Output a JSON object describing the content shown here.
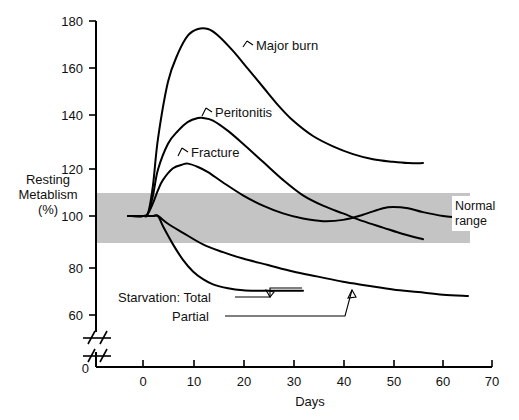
{
  "chart_data": {
    "type": "line",
    "title": "",
    "xlabel": "Days",
    "ylabel": "Resting Metablism (%)",
    "ylabel_lines": [
      "Resting",
      "Metablism",
      "(%)"
    ],
    "xlim": [
      -3,
      70
    ],
    "ylim": [
      50,
      180
    ],
    "y_axis_broken": true,
    "y_break_note": "axis break between 0 and 60",
    "grid": false,
    "legend_position": "inline-annotations",
    "x_ticks": [
      0,
      10,
      20,
      30,
      40,
      50,
      60,
      70
    ],
    "x_tick_labels": [
      "0",
      "10",
      "20",
      "30",
      "40",
      "50",
      "60",
      "70"
    ],
    "y_ticks": [
      60,
      80,
      100,
      120,
      140,
      160,
      180
    ],
    "y_tick_labels": [
      "60",
      "80",
      "100",
      "120",
      "140",
      "160",
      "180"
    ],
    "y_origin_label": "0",
    "bands": [
      {
        "name": "Normal range",
        "label": "Normal range",
        "label_lines": [
          "Normal",
          "range"
        ],
        "y_min": 90,
        "y_max": 110,
        "color": "#c4c4c4"
      }
    ],
    "series": [
      {
        "name": "Major burn",
        "label": "Major burn",
        "x": [
          -3,
          0,
          1,
          2,
          3,
          5,
          7,
          9,
          11,
          13,
          15,
          18,
          21,
          24,
          27,
          30,
          34,
          38,
          42,
          46,
          50,
          53,
          56
        ],
        "values": [
          100,
          100,
          101,
          112,
          130,
          152,
          163,
          170,
          172.5,
          172.5,
          170,
          164,
          157,
          150,
          143,
          137,
          131,
          127,
          124,
          122,
          121,
          120.5,
          120.5
        ]
      },
      {
        "name": "Peritonitis",
        "label": "Peritonitis",
        "x": [
          -3,
          0,
          1,
          2,
          3,
          5,
          7,
          9,
          11,
          12,
          14,
          17,
          20,
          24,
          28,
          32,
          36,
          40,
          44,
          48,
          52,
          56
        ],
        "values": [
          100,
          100,
          101,
          108,
          118,
          128,
          133,
          136.5,
          138,
          138,
          137,
          133,
          128,
          121,
          114,
          108,
          104,
          101,
          98,
          95.5,
          93,
          91
        ]
      },
      {
        "name": "Fracture",
        "label": "Fracture",
        "x": [
          -3,
          0,
          1,
          2,
          3,
          4,
          6,
          8,
          9,
          11,
          13,
          16,
          20,
          24,
          28,
          32,
          36,
          40,
          44,
          48,
          50,
          53,
          56,
          60,
          63,
          65
        ],
        "values": [
          100,
          100,
          101,
          105,
          110,
          114,
          118.5,
          120,
          120.3,
          119,
          117,
          113,
          108,
          104,
          101,
          99,
          98,
          98.5,
          100.5,
          103,
          103.5,
          103,
          101.5,
          100,
          99.5,
          99.5
        ]
      },
      {
        "name": "Starvation: Partial",
        "label": "Partial",
        "legend_prefix": "Starvation:",
        "x": [
          -3,
          0,
          2,
          3,
          5,
          8,
          12,
          16,
          20,
          25,
          30,
          35,
          40,
          45,
          50,
          55,
          60,
          65
        ],
        "values": [
          100,
          100,
          100,
          100,
          97,
          93.5,
          89,
          86,
          83.5,
          81,
          78.5,
          76.5,
          74.5,
          73,
          71.5,
          70.5,
          69.5,
          69
        ]
      },
      {
        "name": "Starvation: Total",
        "label": "Total",
        "legend_prefix": "Starvation:",
        "x": [
          -3,
          0,
          2,
          3,
          4,
          6,
          8,
          10,
          12,
          14,
          17,
          20,
          23,
          26,
          29,
          32
        ],
        "values": [
          100,
          100,
          100,
          100,
          96,
          89,
          83,
          78.5,
          75.5,
          73.5,
          72,
          71.2,
          71,
          71,
          71,
          71
        ]
      }
    ],
    "annotations": [
      {
        "text": "Major burn",
        "x": 26,
        "y": 167
      },
      {
        "text": "Peritonitis",
        "x": 21,
        "y": 139
      },
      {
        "text": "Fracture",
        "x": 16,
        "y": 123
      },
      {
        "text": "Starvation: Total",
        "x": 3,
        "y": 69
      },
      {
        "text": "Partial",
        "x": 11,
        "y": 63
      },
      {
        "text": "Normal range",
        "x": 62,
        "y": 100
      }
    ]
  },
  "axes": {
    "x_title": "Days",
    "y_title_lines": [
      "Resting",
      "Metablism",
      "(%)"
    ],
    "origin_label": "0"
  },
  "icons": {
    "axis_break": "axis-break-icon"
  },
  "colors": {
    "band": "#c4c4c4",
    "curve": "#000000",
    "text": "#111111",
    "background": "#ffffff"
  }
}
